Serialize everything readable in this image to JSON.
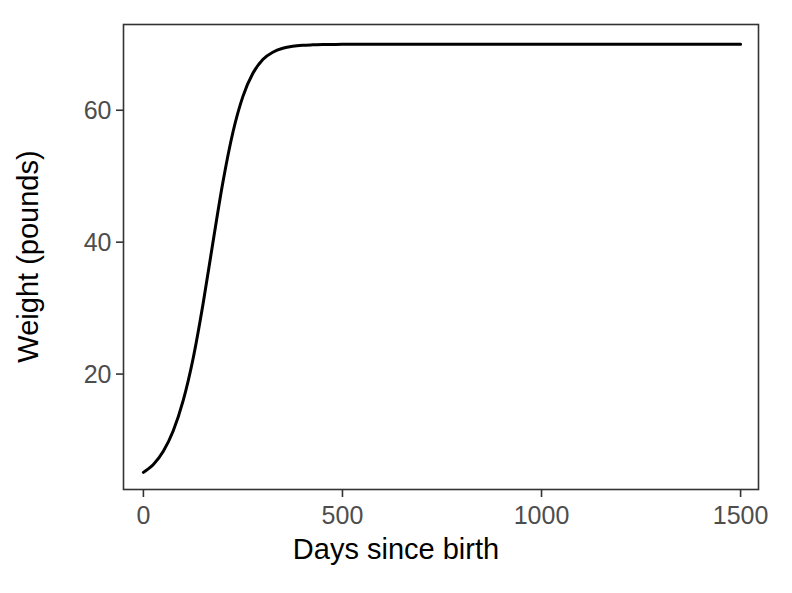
{
  "chart_data": {
    "type": "line",
    "title": "",
    "xlabel": "Days since birth",
    "ylabel": "Weight (pounds)",
    "xlim": [
      -50,
      1545
    ],
    "ylim": [
      2.5,
      73
    ],
    "xticks": [
      0,
      500,
      1000,
      1500
    ],
    "xtick_labels": [
      "0",
      "500",
      "1000",
      "1500"
    ],
    "yticks": [
      20,
      40,
      60
    ],
    "ytick_labels": [
      "20",
      "40",
      "60"
    ],
    "grid": false,
    "legend": null,
    "series": [
      {
        "name": "Growth curve",
        "color": "#000000",
        "line_width": 3,
        "x": [
          0,
          25,
          50,
          75,
          100,
          125,
          150,
          175,
          200,
          225,
          250,
          275,
          300,
          325,
          350,
          375,
          400,
          425,
          450,
          475,
          500,
          550,
          600,
          700,
          800,
          900,
          1000,
          1100,
          1200,
          1300,
          1400,
          1500
        ],
        "y": [
          5.1,
          6.3,
          8.3,
          11.4,
          16.0,
          22.4,
          30.7,
          40.1,
          49.2,
          56.7,
          62.1,
          65.6,
          67.7,
          68.8,
          69.4,
          69.7,
          69.85,
          69.92,
          69.96,
          69.98,
          69.99,
          70.0,
          70.0,
          70.0,
          70.0,
          70.0,
          70.0,
          70.0,
          70.0,
          70.0,
          70.0,
          70.0
        ]
      }
    ],
    "asymptote": 70,
    "start_value": 5.1,
    "panel_border_color": "#333333",
    "background_color": "#ffffff"
  },
  "axes": {
    "x_title": "Days since birth",
    "y_title": "Weight (pounds)"
  },
  "ticks": {
    "x": [
      "0",
      "500",
      "1000",
      "1500"
    ],
    "y": [
      "20",
      "40",
      "60"
    ]
  }
}
